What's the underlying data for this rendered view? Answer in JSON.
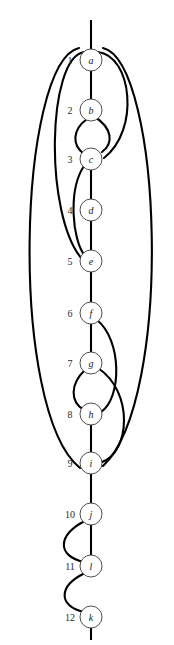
{
  "diagram": {
    "kind": "knot-diagram",
    "title": "",
    "geometry": {
      "width": 174,
      "height": 645,
      "spine_x": 91,
      "node_radius": 11,
      "index_offset_x": -21
    },
    "style": {
      "edge_color": "#000000",
      "node_fill": "#ffffff",
      "node_stroke": "#3b3b3b",
      "label_color": "#1a1a1a",
      "index_color": "#2a2a2a",
      "background": "#ffffff"
    },
    "nodes": [
      {
        "index": "1",
        "label": "a",
        "cx": 91,
        "cy": 60
      },
      {
        "index": "2",
        "label": "b",
        "cx": 91,
        "cy": 110
      },
      {
        "index": "3",
        "label": "c",
        "cx": 91,
        "cy": 159
      },
      {
        "index": "4",
        "label": "d",
        "cx": 91,
        "cy": 210
      },
      {
        "index": "5",
        "label": "e",
        "cx": 91,
        "cy": 261
      },
      {
        "index": "6",
        "label": "f",
        "cx": 91,
        "cy": 313
      },
      {
        "index": "7",
        "label": "g",
        "cx": 91,
        "cy": 363
      },
      {
        "index": "8",
        "label": "h",
        "cx": 91,
        "cy": 414
      },
      {
        "index": "9",
        "label": "i",
        "cx": 91,
        "cy": 463
      },
      {
        "index": "10",
        "label": "j",
        "cx": 91,
        "cy": 514
      },
      {
        "index": "11",
        "label": "l",
        "cx": 91,
        "cy": 566
      },
      {
        "index": "12",
        "label": "k",
        "cx": 91,
        "cy": 617
      }
    ],
    "edges": [
      {
        "name": "stem-top",
        "d": "M 91 20 L 91 49"
      },
      {
        "name": "spine-a-b",
        "d": "M 91 71 L 91 99"
      },
      {
        "name": "spine-c-d",
        "d": "M 91 170 L 91 199"
      },
      {
        "name": "spine-d-e",
        "d": "M 91 221 L 91 250"
      },
      {
        "name": "spine-e-f",
        "d": "M 91 272 L 91 302"
      },
      {
        "name": "spine-f-g",
        "d": "M 91 324 L 91 352"
      },
      {
        "name": "spine-h-i",
        "d": "M 91 425 L 91 452"
      },
      {
        "name": "spine-i-j",
        "d": "M 91 474 L 91 503"
      },
      {
        "name": "spine-j-l",
        "d": "M 91 525 L 91 555"
      },
      {
        "name": "stem-bottom",
        "d": "M 91 628 L 91 640"
      },
      {
        "name": "arc-b-c-right",
        "d": "M 95 117 C 112 128 114 143 102 152"
      },
      {
        "name": "arc-b-c-left",
        "d": "M 87 119 C 72 130 72 145 84 154"
      },
      {
        "name": "arc-a-c-outer-right",
        "d": "M 98 52 C 132 56 140 130 104 158"
      },
      {
        "name": "arc-a-e-outer-left",
        "d": "M 84 52 C 47 58 44 215 82 259"
      },
      {
        "name": "arc-c-e-left",
        "d": "M 84 166 C 68 190 72 240 85 256"
      },
      {
        "name": "arc-f-h-right",
        "d": "M 97 320 C 122 340 122 398 101 412"
      },
      {
        "name": "arc-g-h-left",
        "d": "M 85 370 C 70 384 70 402 84 410"
      },
      {
        "name": "arc-g-i-outer-right",
        "d": "M 98 368 C 134 392 130 452 102 462"
      },
      {
        "name": "arc-a-i-far-right",
        "d": "M 103 48 C 162 62 174 400 103 466"
      },
      {
        "name": "arc-a-i-far-left",
        "d": "M 79 48 C 18 62 8 410 80 468"
      },
      {
        "name": "arc-j-l-left",
        "d": "M 85 521 C 58 534 56 556 84 562"
      },
      {
        "name": "arc-l-k-left",
        "d": "M 85 573 C 58 586 58 606 84 612"
      }
    ]
  }
}
